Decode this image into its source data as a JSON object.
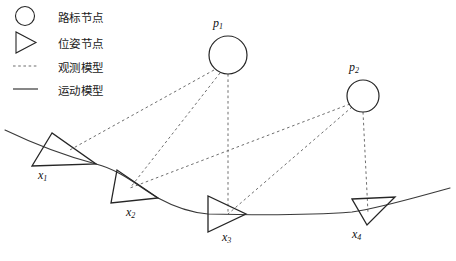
{
  "figure": {
    "type": "diagram",
    "background_color": "#ffffff",
    "stroke_color": "#262626",
    "dashed_color": "#6e6e6e"
  },
  "legend": {
    "items": [
      {
        "key": "landmark",
        "glyph": "circle-outline",
        "label": "路标节点"
      },
      {
        "key": "pose",
        "glyph": "triangle-outline",
        "label": "位姿节点"
      },
      {
        "key": "observation",
        "glyph": "dotted-line",
        "label": "观测模型"
      },
      {
        "key": "motion",
        "glyph": "solid-line",
        "label": "运动模型"
      }
    ]
  },
  "landmarks": [
    {
      "id": "p1",
      "label": "p",
      "subscript": "1",
      "cx": 228,
      "cy": 55,
      "r": 19,
      "label_x": 213,
      "label_y": 16
    },
    {
      "id": "p2",
      "label": "p",
      "subscript": "2",
      "cx": 363,
      "cy": 96,
      "r": 16,
      "label_x": 349,
      "label_y": 60
    }
  ],
  "poses": [
    {
      "id": "x1",
      "label": "x",
      "subscript": "1",
      "points": "52,133 32,166 96,164",
      "label_x": 38,
      "label_y": 168
    },
    {
      "id": "x2",
      "label": "x",
      "subscript": "2",
      "points": "117,170 111,203 158,198",
      "label_x": 126,
      "label_y": 205
    },
    {
      "id": "x3",
      "label": "x",
      "subscript": "3",
      "points": "208,196 208,232 246,214",
      "label_x": 222,
      "label_y": 230
    },
    {
      "id": "x4",
      "label": "x",
      "subscript": "4",
      "points": "352,199 395,197 367,225",
      "label_x": 352,
      "label_y": 227
    }
  ],
  "observation_edges": [
    {
      "from": "p1",
      "to": "x1",
      "x1": 214,
      "y1": 70,
      "x2": 68,
      "y2": 151
    },
    {
      "from": "p1",
      "to": "x2",
      "x1": 220,
      "y1": 73,
      "x2": 130,
      "y2": 188
    },
    {
      "from": "p1",
      "to": "x3",
      "x1": 228,
      "y1": 74,
      "x2": 228,
      "y2": 214
    },
    {
      "from": "p2",
      "to": "x2",
      "x1": 350,
      "y1": 104,
      "x2": 130,
      "y2": 188
    },
    {
      "from": "p2",
      "to": "x3",
      "x1": 352,
      "y1": 107,
      "x2": 228,
      "y2": 214
    },
    {
      "from": "p2",
      "to": "x4",
      "x1": 363,
      "y1": 112,
      "x2": 368,
      "y2": 213
    }
  ],
  "motion_path": {
    "description": "robot trajectory through pose nodes x1 to x4",
    "d": "M 5,130 C 30,142 58,154 96,164 C 120,170 138,186 158,198 C 180,210 196,213 208,214 C 250,215 300,216 352,212 C 380,208 420,196 450,188"
  }
}
